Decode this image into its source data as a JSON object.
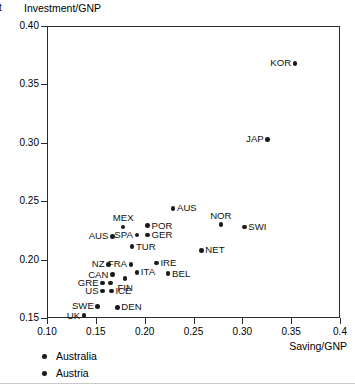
{
  "figure": {
    "edge_glyph": "t",
    "bottom_rule": "divider"
  },
  "chart_data": {
    "type": "scatter",
    "title": "",
    "xlabel": "Saving/GNP",
    "ylabel": "Investment/GNP",
    "xlim": [
      0.1,
      0.4
    ],
    "ylim": [
      0.15,
      0.4
    ],
    "xticks": [
      0.1,
      0.15,
      0.2,
      0.25,
      0.3,
      0.35,
      0.4
    ],
    "xtick_labels": [
      "0.10",
      "0.15",
      "0.20",
      "0.25",
      "0.30",
      "0.35",
      "0.4"
    ],
    "yticks": [
      0.15,
      0.2,
      0.25,
      0.3,
      0.35,
      0.4
    ],
    "ytick_labels": [
      "0.15",
      "0.20",
      "0.25",
      "0.30",
      "0.35",
      "0.40"
    ],
    "grid": false,
    "legend_position": "below-axes-left",
    "marker": "filled-circle",
    "marker_color": "#1a1a1a",
    "points": [
      {
        "label": "KOR",
        "x": 0.354,
        "y": 0.368,
        "label_side": "left"
      },
      {
        "label": "JAP",
        "x": 0.326,
        "y": 0.303,
        "label_side": "left"
      },
      {
        "label": "AUS",
        "x": 0.229,
        "y": 0.244,
        "label_side": "right"
      },
      {
        "label": "NOR",
        "x": 0.278,
        "y": 0.23,
        "label_side": "top"
      },
      {
        "label": "SWI",
        "x": 0.302,
        "y": 0.228,
        "label_side": "right"
      },
      {
        "label": "MEX",
        "x": 0.178,
        "y": 0.228,
        "label_side": "top"
      },
      {
        "label": "POR",
        "x": 0.203,
        "y": 0.229,
        "label_side": "right"
      },
      {
        "label": "GER",
        "x": 0.203,
        "y": 0.221,
        "label_side": "right"
      },
      {
        "label": "SPA",
        "x": 0.192,
        "y": 0.221,
        "label_side": "left"
      },
      {
        "label": "AUS",
        "x": 0.167,
        "y": 0.22,
        "label_side": "left"
      },
      {
        "label": "TUR",
        "x": 0.187,
        "y": 0.211,
        "label_side": "right"
      },
      {
        "label": "NET",
        "x": 0.258,
        "y": 0.208,
        "label_side": "right"
      },
      {
        "label": "IRE",
        "x": 0.212,
        "y": 0.197,
        "label_side": "right"
      },
      {
        "label": "FRA",
        "x": 0.186,
        "y": 0.196,
        "label_side": "left"
      },
      {
        "label": "NZ",
        "x": 0.163,
        "y": 0.196,
        "label_side": "left"
      },
      {
        "label": "ITA",
        "x": 0.192,
        "y": 0.189,
        "label_side": "right"
      },
      {
        "label": "BEL",
        "x": 0.224,
        "y": 0.188,
        "label_side": "right"
      },
      {
        "label": "CAN",
        "x": 0.167,
        "y": 0.187,
        "label_side": "left"
      },
      {
        "label": "FIN",
        "x": 0.18,
        "y": 0.184,
        "label_side": "bottom"
      },
      {
        "label": "GRE",
        "x": 0.157,
        "y": 0.18,
        "label_side": "left"
      },
      {
        "label": "",
        "x": 0.165,
        "y": 0.18,
        "label_side": "none"
      },
      {
        "label": "ICE",
        "x": 0.166,
        "y": 0.173,
        "label_side": "right"
      },
      {
        "label": "US",
        "x": 0.157,
        "y": 0.173,
        "label_side": "left"
      },
      {
        "label": "SWE",
        "x": 0.152,
        "y": 0.16,
        "label_side": "left"
      },
      {
        "label": "UK",
        "x": 0.138,
        "y": 0.152,
        "label_side": "left"
      },
      {
        "label": "DEN",
        "x": 0.172,
        "y": 0.159,
        "label_side": "right"
      }
    ],
    "legend": [
      {
        "label": "Australia",
        "marker": "filled-circle"
      },
      {
        "label": "Austria",
        "marker": "filled-circle"
      }
    ]
  }
}
